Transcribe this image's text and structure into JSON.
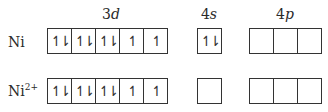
{
  "headers": {
    "d": {
      "num": "3",
      "letter": "d"
    },
    "s": {
      "num": "4",
      "letter": "s"
    },
    "p": {
      "num": "4",
      "letter": "p"
    }
  },
  "rows": [
    {
      "label": "Ni",
      "charge": "",
      "d": [
        "↿⇂",
        "↿⇂",
        "↿⇂",
        "↿",
        "↿"
      ],
      "s": [
        "↿⇂"
      ],
      "p": [
        "",
        "",
        ""
      ]
    },
    {
      "label": "Ni",
      "charge": "2+",
      "d": [
        "↿⇂",
        "↿⇂",
        "↿⇂",
        "↿",
        "↿"
      ],
      "s": [
        ""
      ],
      "p": [
        "",
        "",
        ""
      ]
    }
  ]
}
